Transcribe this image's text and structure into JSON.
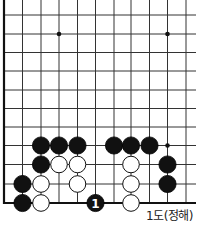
{
  "diagram": {
    "type": "go-board-fragment",
    "caption": "1도(정해)",
    "board": {
      "left_edge_x": 4,
      "bottom_edge_y": 203,
      "col_x": [
        4,
        22.5,
        41,
        59,
        77.5,
        95.5,
        114,
        131,
        149.5,
        167.5,
        186
      ],
      "row_y": [
        15,
        34,
        52.5,
        71,
        90,
        108.5,
        127,
        145.5,
        164.5,
        184,
        203
      ],
      "right_x": 196,
      "top_y": 0,
      "line_color": "#333333",
      "edge_color": "#111111"
    },
    "star_points": [
      {
        "col": 3,
        "row": 1
      },
      {
        "col": 9,
        "row": 1
      },
      {
        "col": 9,
        "row": 7
      }
    ],
    "stones": [
      {
        "color": "black",
        "col": 2,
        "row": 7
      },
      {
        "color": "black",
        "col": 3,
        "row": 7
      },
      {
        "color": "black",
        "col": 4,
        "row": 7
      },
      {
        "color": "black",
        "col": 6,
        "row": 7
      },
      {
        "color": "black",
        "col": 7,
        "row": 7
      },
      {
        "color": "black",
        "col": 8,
        "row": 7
      },
      {
        "color": "black",
        "col": 2,
        "row": 8
      },
      {
        "color": "white",
        "col": 3,
        "row": 8
      },
      {
        "color": "white",
        "col": 4,
        "row": 8
      },
      {
        "color": "white",
        "col": 7,
        "row": 8
      },
      {
        "color": "black",
        "col": 9,
        "row": 8
      },
      {
        "color": "black",
        "col": 1,
        "row": 9
      },
      {
        "color": "white",
        "col": 2,
        "row": 9
      },
      {
        "color": "white",
        "col": 4,
        "row": 9
      },
      {
        "color": "white",
        "col": 7,
        "row": 9
      },
      {
        "color": "black",
        "col": 9,
        "row": 9
      },
      {
        "color": "black",
        "col": 1,
        "row": 10
      },
      {
        "color": "white",
        "col": 2,
        "row": 10
      },
      {
        "color": "black",
        "col": 5,
        "row": 10,
        "label": "1"
      },
      {
        "color": "white",
        "col": 7,
        "row": 10
      }
    ]
  }
}
